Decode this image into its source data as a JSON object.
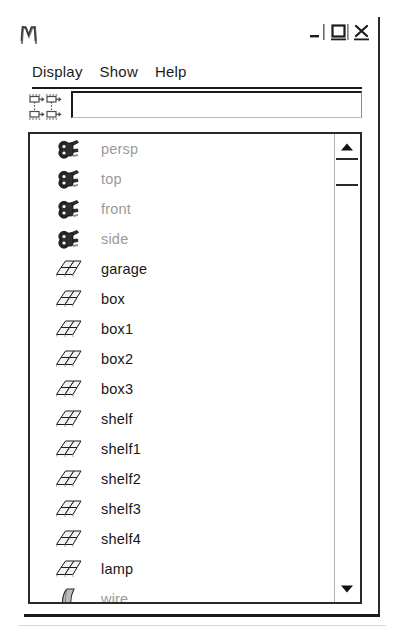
{
  "window": {
    "app_icon": "maya-m-logo-icon",
    "buttons": [
      {
        "name": "minimize-button",
        "icon": "minimize-icon",
        "label": "_"
      },
      {
        "name": "maximize-button",
        "icon": "maximize-icon",
        "label": "□"
      },
      {
        "name": "close-button",
        "icon": "close-icon",
        "label": "×"
      }
    ]
  },
  "menubar": {
    "items": [
      {
        "label": "Display"
      },
      {
        "label": "Show"
      },
      {
        "label": "Help"
      }
    ]
  },
  "filterbar": {
    "icons": [
      {
        "name": "show-inputs-icon"
      },
      {
        "name": "show-outputs-icon"
      },
      {
        "name": "show-inputs-alt-icon"
      },
      {
        "name": "show-outputs-alt-icon"
      }
    ],
    "search": {
      "value": "",
      "placeholder": ""
    }
  },
  "outliner": {
    "rows": [
      {
        "label": "persp",
        "icon": "camera-icon",
        "tone": "dim"
      },
      {
        "label": "top",
        "icon": "camera-icon",
        "tone": "dim"
      },
      {
        "label": "front",
        "icon": "camera-icon",
        "tone": "dim"
      },
      {
        "label": "side",
        "icon": "camera-icon",
        "tone": "dim"
      },
      {
        "label": "garage",
        "icon": "mesh-icon",
        "tone": "dark"
      },
      {
        "label": "box",
        "icon": "mesh-icon",
        "tone": "dark"
      },
      {
        "label": "box1",
        "icon": "mesh-icon",
        "tone": "dark"
      },
      {
        "label": "box2",
        "icon": "mesh-icon",
        "tone": "dark"
      },
      {
        "label": "box3",
        "icon": "mesh-icon",
        "tone": "dark"
      },
      {
        "label": "shelf",
        "icon": "mesh-icon",
        "tone": "dark"
      },
      {
        "label": "shelf1",
        "icon": "mesh-icon",
        "tone": "dark"
      },
      {
        "label": "shelf2",
        "icon": "mesh-icon",
        "tone": "dark"
      },
      {
        "label": "shelf3",
        "icon": "mesh-icon",
        "tone": "dark"
      },
      {
        "label": "shelf4",
        "icon": "mesh-icon",
        "tone": "dark"
      },
      {
        "label": "lamp",
        "icon": "mesh-icon",
        "tone": "dark"
      },
      {
        "label": "wire",
        "icon": "curve-icon",
        "tone": "dim"
      }
    ]
  },
  "scrollbar": {
    "up_arrow": "scroll-up-arrow-icon",
    "down_arrow": "scroll-down-arrow-icon",
    "thumb": "scroll-thumb"
  },
  "colors": {
    "text_dark": "#171717",
    "text_dim": "#9a9a9a",
    "border": "#2a2a2a",
    "background": "#ffffff"
  }
}
